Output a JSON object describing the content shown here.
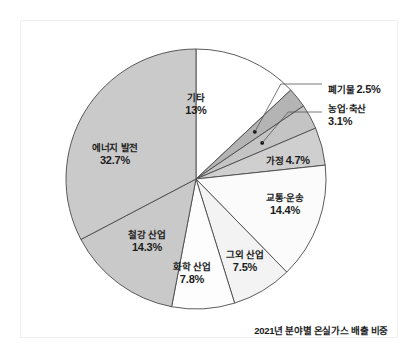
{
  "caption": "2021년 분야별 온실가스 배출 비중",
  "chart_data": {
    "type": "pie",
    "title": "2021년 분야별 온실가스 배출 비중",
    "unit": "%",
    "total": 100,
    "start_angle_deg": 0,
    "direction": "clockwise",
    "legend": "none",
    "grid": false,
    "categories": [
      "기타",
      "폐기물",
      "농업·축산",
      "가정",
      "교통·운송",
      "그외 산업",
      "화학 산업",
      "철강 산업",
      "에너지 발전"
    ],
    "values": [
      13,
      2.5,
      3.1,
      4.7,
      14.4,
      7.5,
      7.8,
      14.3,
      32.7
    ],
    "value_labels": [
      "13%",
      "2.5%",
      "3.1%",
      "4.7%",
      "14.4%",
      "7.5%",
      "7.8%",
      "14.3%",
      "32.7%"
    ],
    "colors": [
      "#ffffff",
      "#b4b4b4",
      "#c4c4c4",
      "#cfcfcf",
      "#fbfbfb",
      "#f3f3f3",
      "#fdfdfd",
      "#c9c9c9",
      "#cacaca"
    ],
    "slices": [
      {
        "name": "기타",
        "value": 13,
        "value_label": "13%",
        "color": "#ffffff",
        "label_placement": "inside",
        "callout": false
      },
      {
        "name": "폐기물",
        "value": 2.5,
        "value_label": "2.5%",
        "color": "#b4b4b4",
        "label_placement": "outside",
        "callout": true
      },
      {
        "name": "농업·축산",
        "value": 3.1,
        "value_label": "3.1%",
        "color": "#c4c4c4",
        "label_placement": "outside",
        "callout": true
      },
      {
        "name": "가정",
        "value": 4.7,
        "value_label": "4.7%",
        "color": "#cfcfcf",
        "label_placement": "inside",
        "callout": false
      },
      {
        "name": "교통·운송",
        "value": 14.4,
        "value_label": "14.4%",
        "color": "#fbfbfb",
        "label_placement": "inside",
        "callout": false
      },
      {
        "name": "그외 산업",
        "value": 7.5,
        "value_label": "7.5%",
        "color": "#f3f3f3",
        "label_placement": "inside",
        "callout": false
      },
      {
        "name": "화학 산업",
        "value": 7.8,
        "value_label": "7.8%",
        "color": "#fdfdfd",
        "label_placement": "inside",
        "callout": false
      },
      {
        "name": "철강 산업",
        "value": 14.3,
        "value_label": "14.3%",
        "color": "#c9c9c9",
        "label_placement": "inside",
        "callout": false
      },
      {
        "name": "에너지 발전",
        "value": 32.7,
        "value_label": "32.7%",
        "color": "#cacaca",
        "label_placement": "inside",
        "callout": false
      }
    ]
  },
  "labels": {
    "etc": {
      "name": "기타",
      "value": "13%"
    },
    "waste": {
      "name": "폐기물",
      "value": "2.5%"
    },
    "agriculture": {
      "name": "농업·축산",
      "value": "3.1%"
    },
    "household": {
      "name": "가정",
      "value": "4.7%"
    },
    "transport": {
      "name": "교통·운송",
      "value": "14.4%"
    },
    "other_ind": {
      "name": "그외 산업",
      "value": "7.5%"
    },
    "chemical": {
      "name": "화학 산업",
      "value": "7.8%"
    },
    "steel": {
      "name": "철강 산업",
      "value": "14.3%"
    },
    "energy": {
      "name": "에너지 발전",
      "value": "32.7%"
    }
  },
  "style": {
    "stroke": "#4a4a4a",
    "background": "#ffffff",
    "text": "#1c1c1c"
  }
}
